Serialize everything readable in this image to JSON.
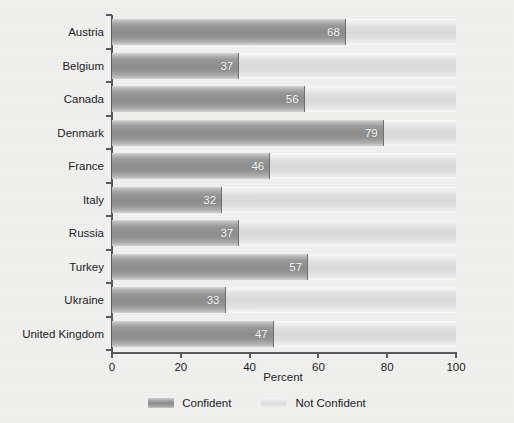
{
  "chart_data": {
    "type": "bar",
    "orientation": "horizontal",
    "stacked": true,
    "title": "",
    "xlabel": "Percent",
    "ylabel": "",
    "xlim": [
      0,
      100
    ],
    "xticks": [
      0,
      20,
      40,
      60,
      80,
      100
    ],
    "grid": false,
    "legend_position": "bottom",
    "categories": [
      "Austria",
      "Belgium",
      "Canada",
      "Denmark",
      "France",
      "Italy",
      "Russia",
      "Turkey",
      "Ukraine",
      "United Kingdom"
    ],
    "series": [
      {
        "name": "Confident",
        "color": "#8d8d8d",
        "values": [
          68,
          37,
          56,
          79,
          46,
          32,
          37,
          57,
          33,
          47
        ]
      },
      {
        "name": "Not Confident",
        "color": "#dddddd",
        "values": [
          32,
          63,
          44,
          21,
          54,
          68,
          63,
          43,
          67,
          53
        ]
      }
    ],
    "data_labels": [
      "68",
      "37",
      "56",
      "79",
      "46",
      "32",
      "37",
      "57",
      "33",
      "47"
    ]
  },
  "axis": {
    "x_title": "Percent",
    "tick_labels": [
      "0",
      "20",
      "40",
      "60",
      "80",
      "100"
    ]
  },
  "legend": {
    "items": [
      {
        "label": "Confident"
      },
      {
        "label": "Not Confident"
      }
    ]
  },
  "colors": {
    "background": "#f0f0ef",
    "confident": "#8d8d8d",
    "not_confident": "#dddddd",
    "axis": "#5a5a5a",
    "text": "#1c1c1c",
    "value_label": "#ffffff"
  }
}
